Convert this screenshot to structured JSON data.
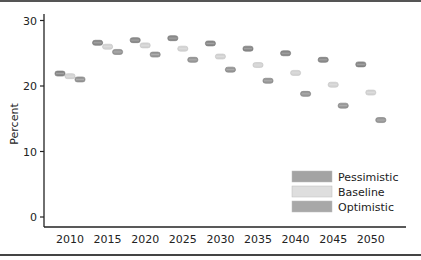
{
  "chart_data": {
    "type": "scatter",
    "title": "",
    "xlabel": "",
    "ylabel": "Percent",
    "ylim": [
      0,
      31
    ],
    "yticks": [
      0,
      10,
      20,
      30
    ],
    "categories": [
      "2010",
      "2015",
      "2020",
      "2025",
      "2030",
      "2035",
      "2040",
      "2045",
      "2050"
    ],
    "grid": false,
    "legend_position": "lower right",
    "series": [
      {
        "name": "Pessimistic",
        "color": "#8c8c8c",
        "values": [
          21.9,
          26.6,
          27.0,
          27.3,
          26.5,
          25.7,
          25.0,
          24.0,
          23.3
        ]
      },
      {
        "name": "Baseline",
        "color": "#d4d4d4",
        "values": [
          21.5,
          26.0,
          26.2,
          25.7,
          24.5,
          23.2,
          22.0,
          20.2,
          19.0
        ]
      },
      {
        "name": "Optimistic",
        "color": "#999999",
        "values": [
          21.0,
          25.2,
          24.8,
          24.0,
          22.5,
          20.8,
          18.8,
          17.0,
          14.8
        ]
      }
    ]
  },
  "axis": {
    "ylabel": "Percent",
    "yticks": [
      "0",
      "10",
      "20",
      "30"
    ],
    "xticks": [
      "2010",
      "2015",
      "2020",
      "2025",
      "2030",
      "2035",
      "2040",
      "2045",
      "2050"
    ]
  },
  "legend": {
    "items": [
      {
        "label": "Pessimistic",
        "color": "#a3a3a3"
      },
      {
        "label": "Baseline",
        "color": "#dedede"
      },
      {
        "label": "Optimistic",
        "color": "#a8a8a8"
      }
    ]
  }
}
